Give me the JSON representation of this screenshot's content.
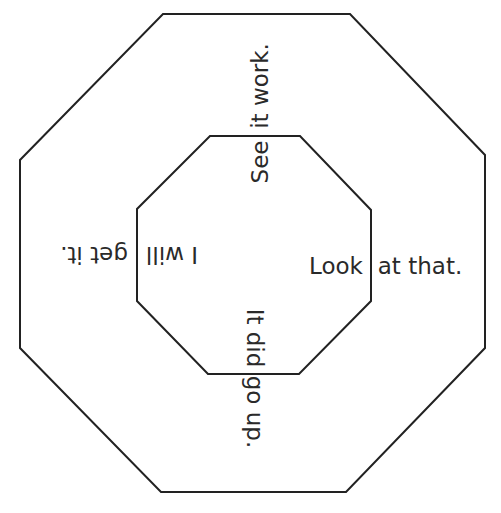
{
  "diagram": {
    "shapes": {
      "outer_octagon": "octagon",
      "inner_octagon": "octagon"
    },
    "stroke_color": "#222222",
    "text_color": "#2a2a2a",
    "sentences": {
      "top": {
        "inner": "See",
        "outer": "it work."
      },
      "right": {
        "inner": "Look",
        "outer": "at that."
      },
      "bottom": {
        "inner": "It did",
        "outer": "go up."
      },
      "left": {
        "inner": "I will",
        "outer": "get it."
      }
    }
  }
}
